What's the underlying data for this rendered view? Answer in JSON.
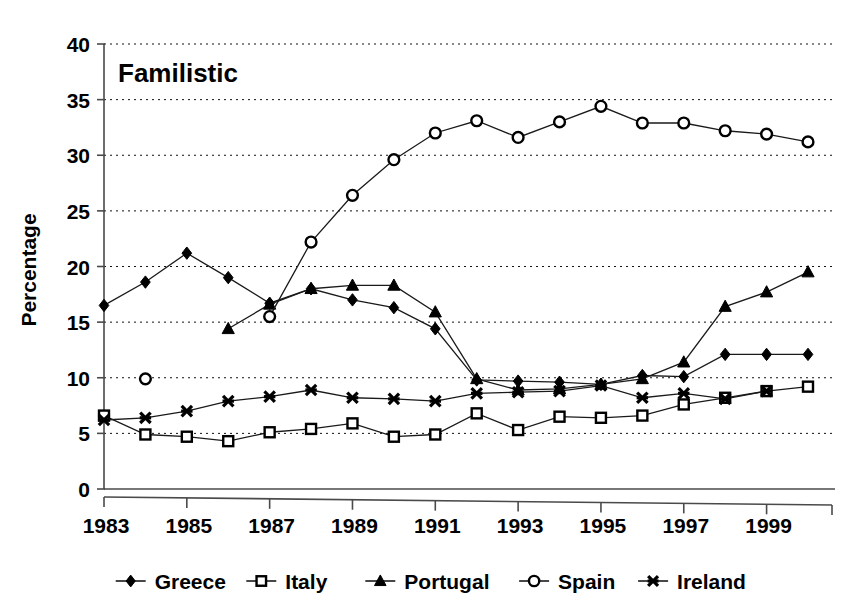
{
  "chart_data": {
    "type": "line",
    "title": "Familistic",
    "xlabel": "",
    "ylabel": "Percentage",
    "ylim": [
      0,
      40
    ],
    "ytick_step": 5,
    "yticks": [
      0,
      5,
      10,
      15,
      20,
      25,
      30,
      35,
      40
    ],
    "xlim": [
      1983,
      2000
    ],
    "xticks": [
      1983,
      1985,
      1987,
      1989,
      1991,
      1993,
      1995,
      1997,
      1999
    ],
    "xticklabels": [
      "1983",
      "1985",
      "1987",
      "1989",
      "1991",
      "1993",
      "1995",
      "1997",
      "1999"
    ],
    "x": [
      1983,
      1984,
      1985,
      1986,
      1987,
      1988,
      1989,
      1990,
      1991,
      1992,
      1993,
      1994,
      1995,
      1996,
      1997,
      1998,
      1999,
      2000
    ],
    "grid": "horizontal-dotted",
    "legend_position": "bottom",
    "series": [
      {
        "name": "Greece",
        "marker": "filled-diamond",
        "values": [
          16.5,
          18.6,
          21.2,
          19.0,
          16.7,
          18.0,
          17.0,
          16.3,
          14.4,
          9.8,
          9.7,
          9.6,
          9.4,
          10.2,
          10.1,
          12.1,
          12.1,
          12.1
        ]
      },
      {
        "name": "Italy",
        "marker": "open-square",
        "values": [
          6.6,
          4.9,
          4.7,
          4.3,
          5.1,
          5.4,
          5.9,
          4.7,
          4.9,
          6.8,
          5.3,
          6.5,
          6.4,
          6.6,
          7.6,
          8.2,
          8.8,
          9.2
        ]
      },
      {
        "name": "Portugal",
        "marker": "filled-triangle",
        "values": [
          null,
          null,
          null,
          14.4,
          16.6,
          18.0,
          18.3,
          18.3,
          15.9,
          9.9,
          8.9,
          9.0,
          9.4,
          9.9,
          11.4,
          16.4,
          17.7,
          19.5
        ]
      },
      {
        "name": "Spain",
        "marker": "open-circle",
        "values": [
          null,
          9.9,
          null,
          null,
          15.5,
          22.2,
          26.4,
          29.6,
          32.0,
          33.1,
          31.6,
          33.0,
          34.4,
          32.9,
          32.9,
          32.2,
          31.9,
          31.2
        ]
      },
      {
        "name": "Ireland",
        "marker": "x-cross",
        "values": [
          6.2,
          6.4,
          7.0,
          7.9,
          8.3,
          8.9,
          8.2,
          8.1,
          7.9,
          8.6,
          8.7,
          8.8,
          9.3,
          8.2,
          8.6,
          8.1,
          8.8,
          null
        ]
      }
    ]
  }
}
